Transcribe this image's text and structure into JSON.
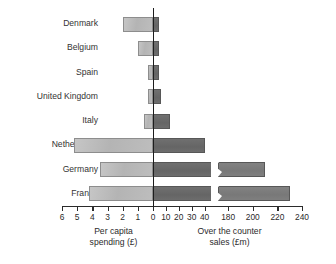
{
  "chart_data": {
    "type": "bar",
    "subtype": "diverging-horizontal-bar",
    "title": "",
    "categories": [
      "Denmark",
      "Belgium",
      "Spain",
      "United Kingdom",
      "Italy",
      "Netherlands",
      "Germany",
      "France"
    ],
    "series": [
      {
        "name": "Per capita spending (£)",
        "side": "left",
        "axis_label": "Per capita spending (£)",
        "unit": "£",
        "tick_labels": [
          "6",
          "5",
          "4",
          "3",
          "2",
          "1",
          "0"
        ],
        "tick_values": [
          6,
          5,
          4,
          3,
          2,
          1,
          0
        ],
        "axis_range": [
          6,
          0
        ],
        "axis_direction": "reversed",
        "values": [
          2.0,
          1.0,
          0.3,
          0.35,
          0.6,
          5.2,
          3.5,
          4.2
        ]
      },
      {
        "name": "Over the counter sales (£m)",
        "side": "right",
        "axis_label": "Over the counter sales (£m)",
        "unit": "£m",
        "tick_labels": [
          "0",
          "10",
          "20",
          "30",
          "40",
          "180",
          "200",
          "220",
          "240"
        ],
        "tick_values": [
          0,
          10,
          20,
          30,
          40,
          180,
          200,
          220,
          240
        ],
        "axis_range": [
          0,
          240
        ],
        "axis_break": {
          "present": true,
          "from": 45,
          "to": 175,
          "style": "zigzag"
        },
        "values": [
          5.0,
          5.0,
          5.0,
          6.0,
          13.0,
          40.0,
          210.0,
          230.0
        ]
      }
    ],
    "grid": false,
    "legend": "none",
    "xlabel_left": "Per capita spending (£)",
    "xlabel_right": "Over the counter sales (£m)",
    "ylabel": ""
  },
  "axis": {
    "left_title_line1": "Per capita",
    "left_title_line2": "spending (£)",
    "right_title_line1": "Over the counter",
    "right_title_line2": "sales (£m)"
  },
  "colors": {
    "bar_left": "#b9b9b9",
    "bar_left_border": "#8d8d8d",
    "bar_right": "#6b6b6b",
    "bar_right_border": "#575757",
    "bar_right_after_break": "#7d7d7d",
    "axis": "#2b2b2b",
    "background": "#ffffff",
    "text": "#333333"
  }
}
